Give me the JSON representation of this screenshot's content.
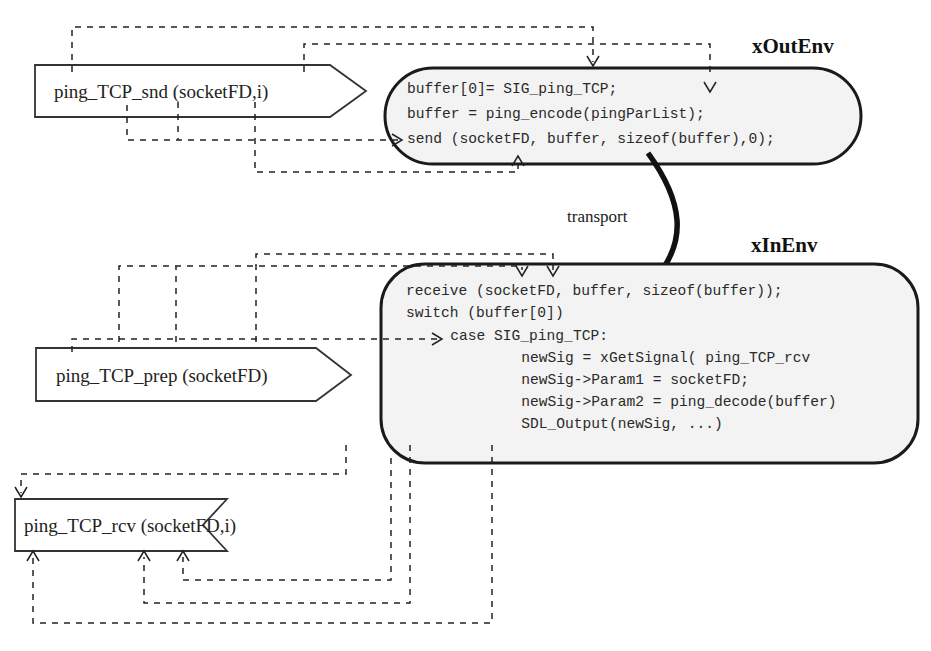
{
  "diagram": {
    "signals": {
      "send": {
        "label": "ping_TCP_snd (socketFD,i)",
        "type": "output-signal"
      },
      "prep": {
        "label": "ping_TCP_prep (socketFD)",
        "type": "output-signal"
      },
      "rcv": {
        "label": "ping_TCP_rcv (socketFD,i)",
        "type": "input-signal"
      }
    },
    "environments": {
      "out": {
        "title": "xOutEnv",
        "code": [
          "buffer[0]= SIG_ping_TCP;",
          "buffer = ping_encode(pingParList);",
          "send (socketFD, buffer, sizeof(buffer),0);"
        ]
      },
      "in": {
        "title": "xInEnv",
        "code": [
          "receive (socketFD, buffer, sizeof(buffer));",
          "switch (buffer[0])",
          "   case SIG_ping_TCP:",
          "       newSig = xGetSignal( ping_TCP_rcv",
          "       newSig->Param1 = socketFD;",
          "       newSig->Param2 = ping_decode(buffer)",
          "       SDL_Output(newSig, ...)"
        ]
      }
    },
    "connector": {
      "label": "transport",
      "icon": "curved-arrow-icon"
    }
  }
}
